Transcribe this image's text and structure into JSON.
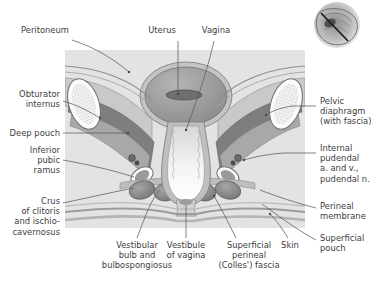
{
  "figure": {
    "panel": {
      "x": 65,
      "y": 50,
      "width": 240,
      "height": 178,
      "bg": "#e3e3e3"
    },
    "colors": {
      "background": "#ffffff",
      "panel_fill": "#e3e3e3",
      "leader_line": "#5a5a5a",
      "text": "#3d3d3d",
      "muscle_dark": "#7c7c7c",
      "muscle_mid": "#9a9a9a",
      "fascia_light": "#c9c9c9",
      "lumen_light": "#f2f2f2",
      "bone_white": "#fbfbfb",
      "bone_speckle": "#8e8e8e",
      "vessel_dark": "#4a4a4a",
      "outline": "#6b6b6b"
    },
    "orientation_thumbnail": {
      "name": "orientation-thumbnail",
      "description": "small sagittal pelvis inset with section plane line",
      "x": 300,
      "y": 0,
      "width": 74,
      "height": 50
    }
  },
  "labels": [
    {
      "id": "peritoneum",
      "text": "Peritoneum",
      "side": "top-left",
      "x": 40,
      "y": 29,
      "align": "center",
      "leader": [
        [
          88,
          40
        ],
        [
          110,
          58
        ],
        [
          128,
          72
        ]
      ]
    },
    {
      "id": "uterus",
      "text": "Uterus",
      "side": "top",
      "x": 160,
      "y": 29,
      "align": "center",
      "leader": [
        [
          178,
          40
        ],
        [
          178,
          68
        ],
        [
          178,
          92
        ]
      ]
    },
    {
      "id": "vagina",
      "text": "Vagina",
      "side": "top",
      "x": 202,
      "y": 29,
      "align": "center",
      "leader": [
        [
          216,
          40
        ],
        [
          200,
          90
        ],
        [
          188,
          128
        ]
      ]
    },
    {
      "id": "obturator-internus",
      "text": "Obturator\ninternus",
      "side": "left",
      "x": 6,
      "y": 93,
      "align": "right",
      "leader": [
        [
          66,
          100
        ],
        [
          84,
          108
        ],
        [
          98,
          116
        ]
      ]
    },
    {
      "id": "deep-pouch",
      "text": "Deep pouch",
      "side": "left",
      "x": 6,
      "y": 130,
      "align": "right",
      "leader": [
        [
          66,
          134
        ],
        [
          104,
          136
        ],
        [
          128,
          134
        ]
      ]
    },
    {
      "id": "inferior-pubic-ramus",
      "text": "Inferior\npubic\nramus",
      "side": "left",
      "x": 6,
      "y": 152,
      "align": "right",
      "leader": [
        [
          66,
          160
        ],
        [
          100,
          166
        ],
        [
          132,
          175
        ]
      ]
    },
    {
      "id": "crus-of-clitoris",
      "text": "Crus\nof clitoris\nand ischio-\ncavernosus",
      "side": "left",
      "x": 6,
      "y": 200,
      "align": "right",
      "leader": [
        [
          66,
          203
        ],
        [
          106,
          196
        ],
        [
          136,
          188
        ]
      ]
    },
    {
      "id": "pelvic-diaphragm",
      "text": "Pelvic\ndiaphragm\n(with fascia)",
      "side": "right",
      "x": 318,
      "y": 100,
      "align": "left",
      "leader": [
        [
          316,
          106
        ],
        [
          296,
          106
        ],
        [
          268,
          114
        ]
      ]
    },
    {
      "id": "internal-pudendal",
      "text": "Internal\npudendal\na. and v.,\npudendal n.",
      "side": "right",
      "x": 318,
      "y": 148,
      "align": "left",
      "leader": [
        [
          316,
          153
        ],
        [
          290,
          153
        ],
        [
          248,
          160
        ]
      ]
    },
    {
      "id": "perineal-membrane",
      "text": "Perineal\nmembrane",
      "side": "right",
      "x": 318,
      "y": 205,
      "align": "left",
      "leader": [
        [
          316,
          209
        ],
        [
          292,
          202
        ],
        [
          262,
          192
        ]
      ]
    },
    {
      "id": "superficial-pouch",
      "text": "Superficial\npouch",
      "side": "right",
      "x": 318,
      "y": 238,
      "align": "left",
      "leader": [
        [
          316,
          241
        ],
        [
          296,
          232
        ],
        [
          268,
          206
        ]
      ]
    },
    {
      "id": "vestibular-bulb",
      "text": "Vestibular\nbulb and\nbulbospongiosus",
      "side": "bottom",
      "x": 87,
      "y": 243,
      "align": "center",
      "leader": [
        [
          138,
          240
        ],
        [
          150,
          210
        ],
        [
          158,
          186
        ]
      ]
    },
    {
      "id": "vestibule-of-vagina",
      "text": "Vestibule\nof vagina",
      "side": "bottom",
      "x": 170,
      "y": 243,
      "align": "center",
      "leader": [
        [
          186,
          240
        ],
        [
          186,
          216
        ],
        [
          186,
          200
        ]
      ]
    },
    {
      "id": "superficial-perineal-fascia",
      "text": "Superficial\nperineal\n(Colles') fascia",
      "side": "bottom",
      "x": 219,
      "y": 243,
      "align": "center",
      "leader": [
        [
          238,
          240
        ],
        [
          224,
          214
        ],
        [
          214,
          192
        ]
      ]
    },
    {
      "id": "skin",
      "text": "Skin",
      "side": "bottom",
      "x": 282,
      "y": 243,
      "align": "center",
      "leader": [
        [
          288,
          240
        ],
        [
          280,
          226
        ],
        [
          272,
          214
        ]
      ]
    }
  ]
}
